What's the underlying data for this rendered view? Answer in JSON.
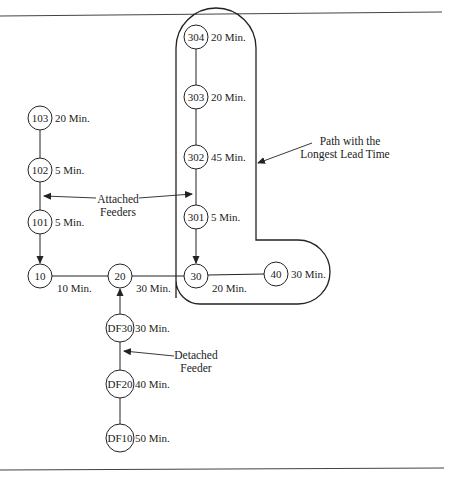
{
  "figure": {
    "nodes": [
      {
        "id": "304",
        "label": "304",
        "time": "20 Min.",
        "x": 196,
        "y": 37,
        "r": 12
      },
      {
        "id": "303",
        "label": "303",
        "time": "20 Min.",
        "x": 196,
        "y": 97,
        "r": 12
      },
      {
        "id": "302",
        "label": "302",
        "time": "45 Min.",
        "x": 196,
        "y": 157,
        "r": 12
      },
      {
        "id": "301",
        "label": "301",
        "time": "5 Min.",
        "x": 196,
        "y": 217,
        "r": 12
      },
      {
        "id": "30",
        "label": "30",
        "time": "20 Min.",
        "x": 196,
        "y": 276,
        "r": 12
      },
      {
        "id": "40",
        "label": "40",
        "time": "30 Min.",
        "x": 276,
        "y": 274,
        "r": 12
      },
      {
        "id": "103",
        "label": "103",
        "time": "20 Min.",
        "x": 40,
        "y": 118,
        "r": 12
      },
      {
        "id": "102",
        "label": "102",
        "time": "5 Min.",
        "x": 40,
        "y": 170,
        "r": 12
      },
      {
        "id": "101",
        "label": "101",
        "time": "5 Min.",
        "x": 40,
        "y": 222,
        "r": 12
      },
      {
        "id": "10",
        "label": "10",
        "time": "10 Min.",
        "x": 40,
        "y": 276,
        "r": 12
      },
      {
        "id": "20",
        "label": "20",
        "time": "30 Min.",
        "x": 120,
        "y": 276,
        "r": 12
      },
      {
        "id": "DF30",
        "label": "DF30",
        "time": "30 Min.",
        "x": 120,
        "y": 328,
        "r": 14
      },
      {
        "id": "DF20",
        "label": "DF20",
        "time": "40  Min.",
        "x": 120,
        "y": 384,
        "r": 14
      },
      {
        "id": "DF10",
        "label": "DF10",
        "time": "50 Min.",
        "x": 120,
        "y": 438,
        "r": 14
      }
    ],
    "annotations": {
      "attached_line1": "Attached",
      "attached_line2": "Feeders",
      "detached_line1": "Detached",
      "detached_line2": "Feeder",
      "longest_line1": "Path with the",
      "longest_line2": "Longest Lead Time"
    }
  },
  "labels": {
    "n304": "304",
    "t304": "20 Min.",
    "n303": "303",
    "t303": "20 Min.",
    "n302": "302",
    "t302": "45 Min.",
    "n301": "301",
    "t301": "5 Min.",
    "n30": "30",
    "t30": "20 Min.",
    "n40": "40",
    "t40": "30 Min.",
    "n103": "103",
    "t103": "20 Min.",
    "n102": "102",
    "t102": "5 Min.",
    "n101": "101",
    "t101": "5 Min.",
    "n10": "10",
    "t10": "10 Min.",
    "n20": "20",
    "t20": "30 Min.",
    "nDF30": "DF30",
    "tDF30": "30 Min.",
    "nDF20": "DF20",
    "tDF20": "40  Min.",
    "nDF10": "DF10",
    "tDF10": "50 Min."
  }
}
